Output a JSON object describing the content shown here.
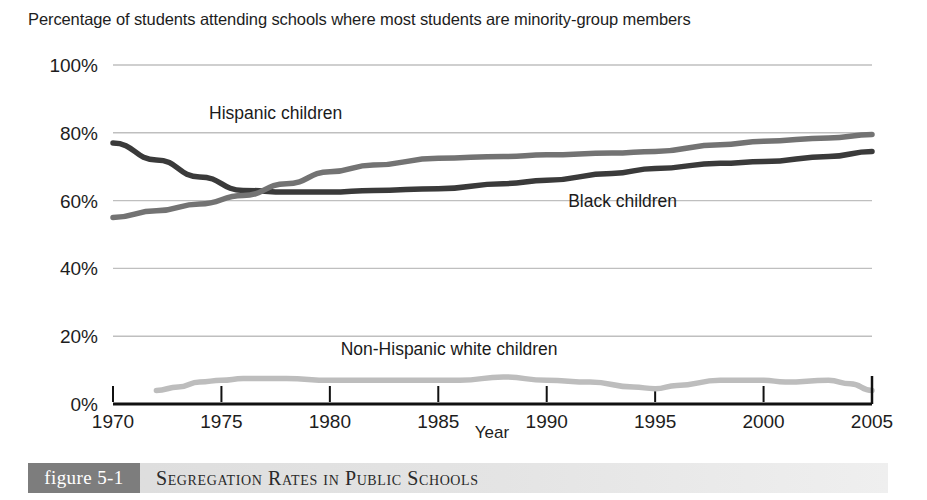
{
  "headline": "Percentage of students attending schools where most students are minority-group members",
  "caption": {
    "badge": "figure 5-1",
    "title": "Segregation Rates in Public Schools"
  },
  "colors": {
    "black_children_line": "#3a3a3a",
    "hispanic_children_line": "#737373",
    "white_children_line": "#bdbdbd",
    "gridline": "#bfbfbf",
    "axis": "#111111",
    "caption_badge_bg": "#7d7d7d",
    "caption_bar_bg": "#e2e2e2"
  },
  "chart_data": {
    "type": "line",
    "title": "Percentage of students attending schools where most students are minority-group members",
    "xlabel": "Year",
    "ylabel": "",
    "xlim": [
      1970,
      2005
    ],
    "ylim": [
      0,
      100
    ],
    "grid": true,
    "legend_position": "inline-labels",
    "x_ticks": [
      "1970",
      "1975",
      "1980",
      "1985",
      "1990",
      "1995",
      "2000",
      "2005"
    ],
    "y_ticks": [
      "0%",
      "20%",
      "40%",
      "60%",
      "80%",
      "100%"
    ],
    "x": [
      1970,
      1975,
      1980,
      1985,
      1990,
      1995,
      2000,
      2005
    ],
    "series": [
      {
        "name": "Black children",
        "color": "#3a3a3a",
        "label_text": "Black children",
        "x": [
          1970,
          1972,
          1974,
          1976,
          1978,
          1980,
          1982,
          1985,
          1988,
          1990,
          1993,
          1995,
          1998,
          2000,
          2003,
          2005
        ],
        "values": [
          77,
          72,
          67,
          63,
          62.5,
          62.5,
          63,
          63.5,
          65,
          66,
          68,
          69.5,
          71,
          71.5,
          73,
          74.5
        ]
      },
      {
        "name": "Hispanic children",
        "color": "#737373",
        "label_text": "Hispanic children",
        "x": [
          1970,
          1972,
          1974,
          1976,
          1978,
          1980,
          1982,
          1985,
          1988,
          1990,
          1993,
          1995,
          1998,
          2000,
          2003,
          2005
        ],
        "values": [
          55,
          57,
          59,
          61.5,
          65,
          68.5,
          70.5,
          72.5,
          73,
          73.5,
          74,
          74.5,
          76.5,
          77.5,
          78.5,
          79.5
        ]
      },
      {
        "name": "Non-Hispanic white children",
        "color": "#bdbdbd",
        "label_text": "Non-Hispanic white children",
        "x": [
          1972,
          1973,
          1974,
          1975,
          1976,
          1978,
          1980,
          1982,
          1984,
          1986,
          1988,
          1990,
          1992,
          1994,
          1995,
          1996,
          1998,
          2000,
          2001,
          2003,
          2004,
          2005
        ],
        "values": [
          4,
          5,
          6.5,
          7,
          7.5,
          7.5,
          7,
          7,
          7,
          7,
          8,
          7,
          6.5,
          5,
          4.5,
          5.5,
          7,
          7,
          6.5,
          7,
          6,
          4
        ]
      }
    ],
    "annotations": [
      {
        "text": "Hispanic children",
        "x": 1977.5,
        "y": 84
      },
      {
        "text": "Black children",
        "x": 1993.5,
        "y": 58
      },
      {
        "text": "Non-Hispanic white children",
        "x": 1985.5,
        "y": 14.5
      }
    ]
  }
}
